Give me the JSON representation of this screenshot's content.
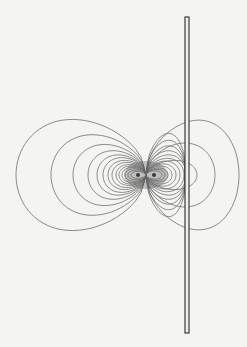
{
  "diagram": {
    "type": "dipole field contour plot with conducting plate",
    "background": "#f4f4f2",
    "line_color": "#6e6e6e",
    "plate_color": "#2a2a2a",
    "center": {
      "x": 146,
      "y": 175
    },
    "poles": [
      {
        "x": 138,
        "y": 175
      },
      {
        "x": 154,
        "y": 175
      }
    ],
    "plate": {
      "x": 185,
      "y_top": 17,
      "y_bottom": 333,
      "width": 4
    },
    "left_lobe_loops": [
      {
        "extent_x": 16,
        "half_height": 80
      },
      {
        "extent_x": 51,
        "half_height": 58
      },
      {
        "extent_x": 73,
        "half_height": 44
      },
      {
        "extent_x": 88,
        "half_height": 35
      },
      {
        "extent_x": 97,
        "half_height": 29
      },
      {
        "extent_x": 103,
        "half_height": 25
      },
      {
        "extent_x": 108,
        "half_height": 21
      },
      {
        "extent_x": 112,
        "half_height": 18
      },
      {
        "extent_x": 116,
        "half_height": 15
      },
      {
        "extent_x": 119,
        "half_height": 13
      },
      {
        "extent_x": 122,
        "half_height": 11
      },
      {
        "extent_x": 125,
        "half_height": 9
      },
      {
        "extent_x": 128,
        "half_height": 7
      },
      {
        "extent_x": 131,
        "half_height": 5
      }
    ],
    "right_lobe_loops": [
      {
        "extent_x": 239,
        "half_height": 79
      },
      {
        "extent_x": 215,
        "half_height": 46
      },
      {
        "extent_x": 197,
        "half_height": 21
      },
      {
        "extent_x": 186,
        "half_height": 60
      },
      {
        "extent_x": 186,
        "half_height": 50
      },
      {
        "extent_x": 186,
        "half_height": 42
      },
      {
        "extent_x": 186,
        "half_height": 35
      },
      {
        "extent_x": 186,
        "half_height": 29
      },
      {
        "extent_x": 184,
        "half_height": 24
      },
      {
        "extent_x": 180,
        "half_height": 20
      },
      {
        "extent_x": 176,
        "half_height": 16
      },
      {
        "extent_x": 172,
        "half_height": 13
      },
      {
        "extent_x": 168,
        "half_height": 10
      },
      {
        "extent_x": 165,
        "half_height": 8
      },
      {
        "extent_x": 162,
        "half_height": 6
      }
    ]
  }
}
